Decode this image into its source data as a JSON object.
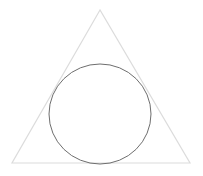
{
  "diagram": {
    "shapes": [
      {
        "id": "triangle",
        "kind": "triangle",
        "stroke": "#dcdcdc",
        "fill": "none"
      },
      {
        "id": "circle",
        "kind": "circle",
        "stroke": "#6e6e6e",
        "fill": "none"
      }
    ],
    "background": "#ffffff"
  }
}
